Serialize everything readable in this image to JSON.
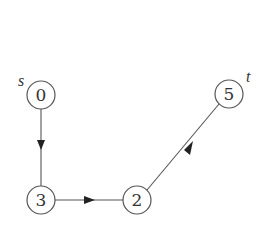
{
  "diagram": {
    "type": "directed-graph",
    "nodes": [
      {
        "id": "0",
        "label": "0",
        "x": 41,
        "y": 95,
        "annotation": "s"
      },
      {
        "id": "3",
        "label": "3",
        "x": 41,
        "y": 200,
        "annotation": ""
      },
      {
        "id": "2",
        "label": "2",
        "x": 137,
        "y": 200,
        "annotation": ""
      },
      {
        "id": "5",
        "label": "5",
        "x": 229,
        "y": 94,
        "annotation": "t"
      }
    ],
    "edges": [
      {
        "from": "0",
        "to": "3"
      },
      {
        "from": "3",
        "to": "2"
      },
      {
        "from": "2",
        "to": "5"
      }
    ],
    "labels": {
      "source": "s",
      "target": "t"
    },
    "colors": {
      "stroke": "#555555",
      "arrowhead": "#222222",
      "text": "#333333",
      "background": "#ffffff"
    }
  }
}
